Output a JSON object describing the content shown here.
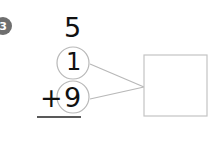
{
  "problem": {
    "number": "3",
    "top_addend": "5",
    "middle_addend": "1",
    "bottom_addend": "9",
    "operator": "+",
    "answer_box": ""
  }
}
